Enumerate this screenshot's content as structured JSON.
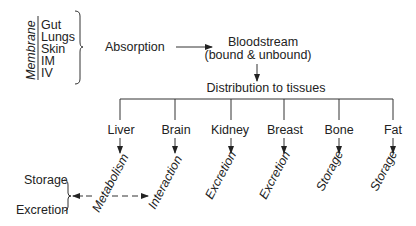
{
  "membrane": {
    "label": "Membrane",
    "routes": [
      "Gut",
      "Lungs",
      "Skin",
      "IM",
      "IV"
    ]
  },
  "absorption": "Absorption",
  "bloodstream": {
    "line1": "Bloodstream",
    "line2": "(bound & unbound)"
  },
  "distribution": "Distribution to tissues",
  "tissues": [
    {
      "name": "Liver",
      "fate": "Metabolism"
    },
    {
      "name": "Brain",
      "fate": "Interaction"
    },
    {
      "name": "Kidney",
      "fate": "Excretion"
    },
    {
      "name": "Breast",
      "fate": "Excretion"
    },
    {
      "name": "Bone",
      "fate": "Storage"
    },
    {
      "name": "Fat",
      "fate": "Storage"
    }
  ],
  "metabolism_outcomes": [
    "Storage",
    "Excretion"
  ]
}
